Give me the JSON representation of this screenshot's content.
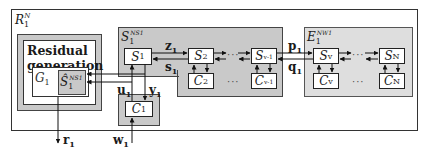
{
  "system": {
    "label": "R",
    "label_sub": "1",
    "label_sup": "N"
  },
  "residual": {
    "title_line1": "Residual",
    "title_line2": "generation",
    "g_label": "G",
    "g_sub": "1",
    "shat_label": "Ŝ",
    "shat_sub": "1",
    "shat_sup": "NS1"
  },
  "subsystem_group": {
    "label": "S",
    "label_sub": "1",
    "label_sup": "NS1"
  },
  "environment_group": {
    "label": "E",
    "label_sub": "1",
    "label_sup": "NW1"
  },
  "blocks": {
    "s1": {
      "label": "S",
      "sub": "1"
    },
    "c1": {
      "label": "C",
      "sub": "1"
    },
    "s2": {
      "label": "S",
      "sub": "2"
    },
    "c2": {
      "label": "C",
      "sub": "2"
    },
    "sv1": {
      "label": "S",
      "sub": "v-1"
    },
    "cv1": {
      "label": "C",
      "sub": "v-1"
    },
    "sv": {
      "label": "S",
      "sub": "v"
    },
    "cv": {
      "label": "C",
      "sub": "v"
    },
    "sn": {
      "label": "S",
      "sub": "N"
    },
    "cn": {
      "label": "C",
      "sub": "N"
    }
  },
  "signals": {
    "z": {
      "label": "z",
      "sub": "1"
    },
    "s": {
      "label": "s",
      "sub": "1"
    },
    "p": {
      "label": "p",
      "sub": "1"
    },
    "q": {
      "label": "q",
      "sub": "1"
    },
    "u": {
      "label": "u",
      "sub": "1"
    },
    "y": {
      "label": "y",
      "sub": "1"
    },
    "w": {
      "label": "w",
      "sub": "1"
    },
    "r": {
      "label": "r",
      "sub": "1"
    }
  },
  "ellipsis": "···"
}
